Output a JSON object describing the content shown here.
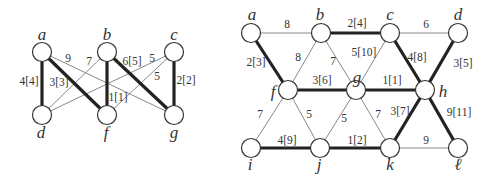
{
  "graphs": [
    {
      "id": "left-graph",
      "nodes": [
        {
          "id": "a",
          "label": "a",
          "x": 42,
          "y": 52,
          "lx": 42,
          "ly": 40
        },
        {
          "id": "b",
          "label": "b",
          "x": 107,
          "y": 52,
          "lx": 107,
          "ly": 40
        },
        {
          "id": "c",
          "label": "c",
          "x": 174,
          "y": 52,
          "lx": 174,
          "ly": 40
        },
        {
          "id": "d",
          "label": "d",
          "x": 42,
          "y": 115,
          "lx": 41,
          "ly": 138
        },
        {
          "id": "f",
          "label": "f",
          "x": 107,
          "y": 115,
          "lx": 106,
          "ly": 138
        },
        {
          "id": "g",
          "label": "g",
          "x": 174,
          "y": 115,
          "lx": 174,
          "ly": 138
        }
      ],
      "edges": [
        {
          "from": "a",
          "to": "d",
          "label": "4[4]",
          "thick": true,
          "lx": 29,
          "ly": 85
        },
        {
          "from": "a",
          "to": "f",
          "label": "3[3]",
          "thick": true,
          "lx": 59,
          "ly": 86
        },
        {
          "from": "a",
          "to": "g",
          "label": "9",
          "thick": false,
          "lx": 68,
          "ly": 62
        },
        {
          "from": "b",
          "to": "d",
          "label": "7",
          "thick": false,
          "lx": 89,
          "ly": 65
        },
        {
          "from": "b",
          "to": "f",
          "label": "1[1]",
          "thick": true,
          "lx": 118,
          "ly": 101
        },
        {
          "from": "b",
          "to": "g",
          "label": "6[5]",
          "thick": true,
          "lx": 132,
          "ly": 65
        },
        {
          "from": "c",
          "to": "d",
          "label": "5",
          "thick": false,
          "lx": 152,
          "ly": 62
        },
        {
          "from": "c",
          "to": "f",
          "label": "5",
          "thick": false,
          "lx": 157,
          "ly": 80
        },
        {
          "from": "c",
          "to": "g",
          "label": "2[2]",
          "thick": true,
          "lx": 186,
          "ly": 84
        }
      ]
    },
    {
      "id": "right-graph",
      "nodes": [
        {
          "id": "a",
          "label": "a",
          "x": 251,
          "y": 33,
          "lx": 252,
          "ly": 20
        },
        {
          "id": "b",
          "label": "b",
          "x": 321,
          "y": 33,
          "lx": 320,
          "ly": 20
        },
        {
          "id": "c",
          "label": "c",
          "x": 390,
          "y": 33,
          "lx": 390,
          "ly": 20
        },
        {
          "id": "d",
          "label": "d",
          "x": 458,
          "y": 33,
          "lx": 458,
          "ly": 20
        },
        {
          "id": "f",
          "label": "f",
          "x": 288,
          "y": 90,
          "lx": 273,
          "ly": 97
        },
        {
          "id": "g",
          "label": "g",
          "x": 356,
          "y": 90,
          "lx": 357,
          "ly": 83
        },
        {
          "id": "h",
          "label": "h",
          "x": 425,
          "y": 90,
          "lx": 443,
          "ly": 97
        },
        {
          "id": "i",
          "label": "i",
          "x": 251,
          "y": 148,
          "lx": 250,
          "ly": 170
        },
        {
          "id": "j",
          "label": "j",
          "x": 320,
          "y": 148,
          "lx": 319,
          "ly": 170
        },
        {
          "id": "k",
          "label": "k",
          "x": 390,
          "y": 148,
          "lx": 390,
          "ly": 170
        },
        {
          "id": "l",
          "label": "ℓ",
          "x": 458,
          "y": 148,
          "lx": 458,
          "ly": 170
        }
      ],
      "edges": [
        {
          "from": "a",
          "to": "b",
          "label": "8",
          "thick": false,
          "lx": 287,
          "ly": 28
        },
        {
          "from": "b",
          "to": "c",
          "label": "2[4]",
          "thick": true,
          "lx": 357,
          "ly": 27
        },
        {
          "from": "c",
          "to": "d",
          "label": "6",
          "thick": false,
          "lx": 426,
          "ly": 28
        },
        {
          "from": "a",
          "to": "f",
          "label": "2[3]",
          "thick": true,
          "lx": 256,
          "ly": 66
        },
        {
          "from": "b",
          "to": "f",
          "label": "8",
          "thick": false,
          "lx": 298,
          "ly": 61
        },
        {
          "from": "b",
          "to": "g",
          "label": "7",
          "thick": false,
          "lx": 333,
          "ly": 65
        },
        {
          "from": "c",
          "to": "g",
          "label": "5[10]",
          "thick": false,
          "lx": 364,
          "ly": 56
        },
        {
          "from": "c",
          "to": "h",
          "label": "4[8]",
          "thick": true,
          "lx": 417,
          "ly": 61
        },
        {
          "from": "d",
          "to": "h",
          "label": "3[5]",
          "thick": true,
          "lx": 463,
          "ly": 67
        },
        {
          "from": "f",
          "to": "g",
          "label": "3[6]",
          "thick": true,
          "lx": 322,
          "ly": 84
        },
        {
          "from": "g",
          "to": "h",
          "label": "1[1]",
          "thick": true,
          "lx": 392,
          "ly": 84
        },
        {
          "from": "f",
          "to": "i",
          "label": "7",
          "thick": false,
          "lx": 260,
          "ly": 118
        },
        {
          "from": "f",
          "to": "j",
          "label": "5",
          "thick": false,
          "lx": 309,
          "ly": 118
        },
        {
          "from": "g",
          "to": "j",
          "label": "5",
          "thick": false,
          "lx": 344,
          "ly": 122
        },
        {
          "from": "g",
          "to": "k",
          "label": "7",
          "thick": false,
          "lx": 378,
          "ly": 118
        },
        {
          "from": "h",
          "to": "k",
          "label": "3[7]",
          "thick": true,
          "lx": 400,
          "ly": 115
        },
        {
          "from": "h",
          "to": "l",
          "label": "9[11]",
          "thick": true,
          "lx": 459,
          "ly": 116
        },
        {
          "from": "i",
          "to": "j",
          "label": "4[9]",
          "thick": true,
          "lx": 287,
          "ly": 144
        },
        {
          "from": "j",
          "to": "k",
          "label": "1[2]",
          "thick": true,
          "lx": 357,
          "ly": 144
        },
        {
          "from": "k",
          "to": "l",
          "label": "9",
          "thick": false,
          "lx": 426,
          "ly": 144
        }
      ]
    }
  ]
}
